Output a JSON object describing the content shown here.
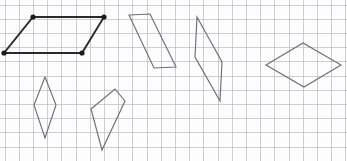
{
  "worksheet": {
    "title": "Grid worksheet with quadrilaterals",
    "width": 347,
    "height": 161,
    "background_color": "#fdfdfd"
  },
  "grid": {
    "label": "graph-paper-grid",
    "color": "#b9b9c4",
    "spacing": 14.2,
    "origin_x": 5,
    "origin_y": 5,
    "columns": 24,
    "rows": 11,
    "visible": true
  },
  "shapes": [
    {
      "name": "parallelogram-highlighted",
      "label": "Parallelogram",
      "emphasis": true,
      "stroke": "#2a2a2e",
      "show_vertices": true,
      "points": "33,17 104,17 82,53 4,53"
    },
    {
      "name": "parallelogram-upper-middle",
      "label": "Parallelogram",
      "emphasis": false,
      "stroke": "#6e6e78",
      "show_vertices": false,
      "points": "129,15 150,14 176,67 154,68"
    },
    {
      "name": "parallelogram-thin-tall",
      "label": "Thin parallelogram",
      "emphasis": false,
      "stroke": "#6e6e78",
      "show_vertices": false,
      "points": "197,17 222,62 220,101 195,57"
    },
    {
      "name": "rhombus-right",
      "label": "Rhombus",
      "emphasis": false,
      "stroke": "#6e6e78",
      "show_vertices": false,
      "points": "266,65 303,43 341,65 304,87"
    },
    {
      "name": "rhombus-left-narrow",
      "label": "Narrow rhombus",
      "emphasis": false,
      "stroke": "#6e6e78",
      "show_vertices": false,
      "points": "45,77 56,105 45,138 34,105"
    },
    {
      "name": "kite-lower-middle",
      "label": "Kite",
      "emphasis": false,
      "stroke": "#6e6e78",
      "show_vertices": false,
      "points": "115,89 125,101 102,150 91,109"
    }
  ],
  "vertices": [
    {
      "name": "vertex-top-left",
      "x": 33,
      "y": 17,
      "r": 2.6
    },
    {
      "name": "vertex-top-right",
      "x": 104,
      "y": 17,
      "r": 2.6
    },
    {
      "name": "vertex-bottom-right",
      "x": 82,
      "y": 53,
      "r": 2.6
    },
    {
      "name": "vertex-bottom-left",
      "x": 4,
      "y": 53,
      "r": 2.6
    }
  ]
}
